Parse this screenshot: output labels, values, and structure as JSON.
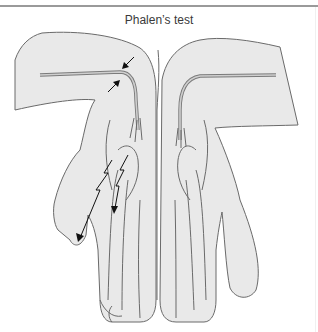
{
  "figure": {
    "title": "Phalen’s test",
    "annotations": {
      "compression_arrows": 2,
      "lightning_paresthesia_arrows": 2
    },
    "colors": {
      "skin_fill": "#e9e9e9",
      "outline": "#6a6a6a",
      "arrow": "#111111",
      "rule": "#9a9a9a"
    }
  }
}
